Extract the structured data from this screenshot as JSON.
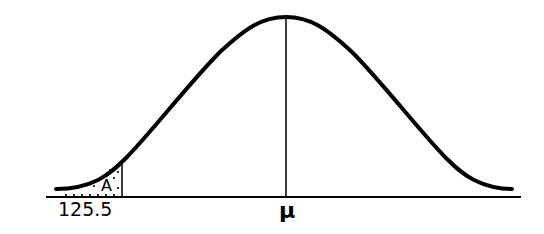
{
  "diagram": {
    "type": "normal-distribution-curve",
    "labels": {
      "cutoff_value": "125.5",
      "mean": "μ",
      "area": "A"
    },
    "colors": {
      "curve": "#000000",
      "axis": "#000000",
      "background": "#ffffff"
    }
  }
}
